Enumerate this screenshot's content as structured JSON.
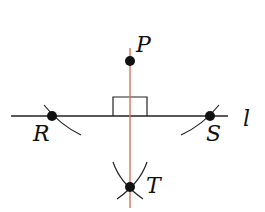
{
  "diagram": {
    "line_label": "l",
    "points": [
      {
        "id": "P",
        "label": "P"
      },
      {
        "id": "R",
        "label": "R"
      },
      {
        "id": "S",
        "label": "S"
      },
      {
        "id": "T",
        "label": "T"
      }
    ],
    "colors": {
      "line": "#222222",
      "perpendicular": "#d9735a",
      "points": "#111111"
    }
  }
}
